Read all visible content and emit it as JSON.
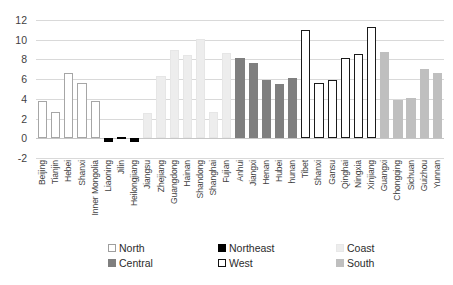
{
  "chart_data": {
    "type": "bar",
    "title": "",
    "xlabel": "",
    "ylabel": "",
    "ylim": [
      -2,
      12
    ],
    "yticks": [
      12,
      10,
      8,
      6,
      4,
      2,
      0,
      -2
    ],
    "grid": true,
    "legend_position": "bottom",
    "categories": [
      "Beijing",
      "Tianjin",
      "Hebei",
      "Shanxi",
      "Inner Mongolia",
      "Liaoning",
      "Jilin",
      "Heilongjiang",
      "Jiangsu",
      "Zhejiang",
      "Guangdong",
      "Hainan",
      "Shandong",
      "Shanghai",
      "Fujian",
      "Anhui",
      "Jiangxi",
      "Henan",
      "Hubei",
      "hunan",
      "Tibet",
      "Shanxi",
      "Gansu",
      "Qinghai",
      "Ningxia",
      "Xinjiang",
      "Guangxi",
      "Chongqing",
      "Sichuan",
      "Guizhou",
      "Yunnan"
    ],
    "values": [
      3.8,
      2.7,
      6.6,
      5.6,
      3.8,
      -0.4,
      0.1,
      -0.4,
      2.6,
      6.3,
      9.0,
      8.5,
      10.1,
      2.7,
      8.7,
      8.1,
      7.6,
      5.9,
      5.5,
      6.1,
      11.0,
      5.6,
      5.9,
      8.1,
      8.6,
      11.3,
      8.8,
      3.9,
      4.1,
      7.0,
      6.6
    ],
    "groups": [
      "North",
      "North",
      "North",
      "North",
      "North",
      "Northeast",
      "Northeast",
      "Northeast",
      "Coast",
      "Coast",
      "Coast",
      "Coast",
      "Coast",
      "Coast",
      "Coast",
      "Central",
      "Central",
      "Central",
      "Central",
      "Central",
      "West",
      "West",
      "West",
      "West",
      "West",
      "West",
      "South",
      "South",
      "South",
      "South",
      "South"
    ],
    "legend": [
      {
        "label": "North",
        "color": "#ffffff",
        "key": "north"
      },
      {
        "label": "Central",
        "color": "#7f7f7f",
        "key": "central"
      },
      {
        "label": "Northeast",
        "color": "#000000",
        "key": "northeast"
      },
      {
        "label": "West",
        "color": "#ffffff",
        "key": "west"
      },
      {
        "label": "Coast",
        "color": "#ededed",
        "key": "coast"
      },
      {
        "label": "South",
        "color": "#bfbfbf",
        "key": "south"
      }
    ]
  }
}
